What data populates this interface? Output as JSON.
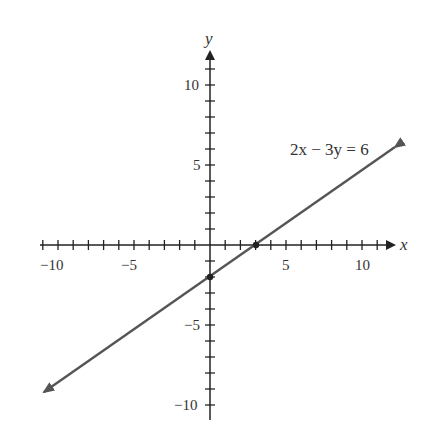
{
  "chart_data": {
    "type": "line",
    "title": "",
    "xlabel": "x",
    "ylabel": "y",
    "xlim": [
      -11,
      12
    ],
    "ylim": [
      -11,
      12
    ],
    "x_ticks": [
      -10,
      -5,
      5,
      10
    ],
    "y_ticks": [
      -10,
      -5,
      5,
      10
    ],
    "grid": false,
    "series": [
      {
        "name": "2x − 3y = 6",
        "equation": "2x − 3y = 6",
        "slope": 0.6667,
        "intercept": -2,
        "x": [
          -11,
          12
        ],
        "y": [
          -9.33,
          6
        ]
      }
    ],
    "points": [
      {
        "label": "x-intercept",
        "x": 3,
        "y": 0
      },
      {
        "label": "y-intercept",
        "x": 0,
        "y": -2
      }
    ],
    "annotations": [
      {
        "text": "2x − 3y = 6",
        "x": 5.3,
        "y": 6.2
      }
    ]
  },
  "labels": {
    "x_axis": "x",
    "y_axis": "y",
    "equation": "2x − 3y = 6",
    "tick_neg10": "−10",
    "tick_neg5": "−5",
    "tick_5": "5",
    "tick_10": "10"
  },
  "colors": {
    "axis": "#222222",
    "line": "#555555"
  }
}
